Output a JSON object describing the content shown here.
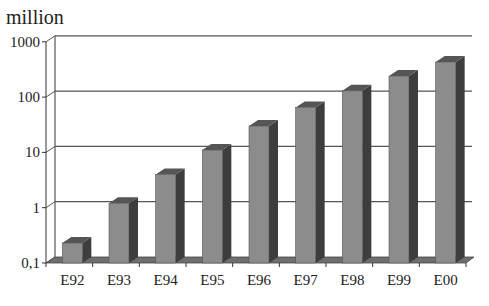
{
  "chart_data": {
    "type": "bar",
    "title": "",
    "unit_label": "million",
    "xlabel": "",
    "ylabel": "million",
    "yscale": "log",
    "ylim": [
      0.1,
      1000
    ],
    "yticks": [
      "0,1",
      "1",
      "10",
      "100",
      "1000"
    ],
    "ytick_values": [
      0.1,
      1,
      10,
      100,
      1000
    ],
    "categories": [
      "E92",
      "E93",
      "E94",
      "E95",
      "E96",
      "E97",
      "E98",
      "E99",
      "E00"
    ],
    "values": [
      0.23,
      1.2,
      4,
      11,
      30,
      65,
      130,
      240,
      430
    ],
    "grid": true,
    "legend": null,
    "style": "3d-column",
    "colors": {
      "bar_front": "#8c8c8c",
      "bar_side": "#3d3d3d",
      "bar_top": "#555555",
      "grid": "#555555",
      "floor": "#6e6e6e"
    }
  }
}
